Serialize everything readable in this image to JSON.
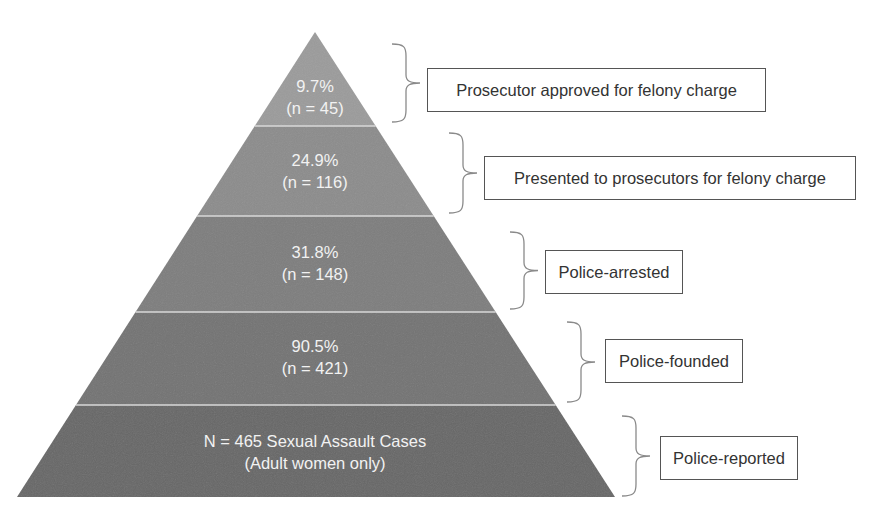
{
  "chart_data": {
    "type": "pyramid",
    "title": "",
    "total": {
      "n": 465,
      "label": "N = 465 Sexual Assault Cases",
      "sublabel": "(Adult women only)"
    },
    "tiers": [
      {
        "stage": "Prosecutor approved for felony charge",
        "percent": 9.7,
        "n": 45,
        "line1": "9.7%",
        "line2": "(n = 45)"
      },
      {
        "stage": "Presented to prosecutors for felony charge",
        "percent": 24.9,
        "n": 116,
        "line1": "24.9%",
        "line2": "(n = 116)"
      },
      {
        "stage": "Police-arrested",
        "percent": 31.8,
        "n": 148,
        "line1": "31.8%",
        "line2": "(n = 148)"
      },
      {
        "stage": "Police-founded",
        "percent": 90.5,
        "n": 421,
        "line1": "90.5%",
        "line2": "(n = 421)"
      },
      {
        "stage": "Police-reported",
        "percent": 100,
        "n": 465,
        "line1": "N = 465 Sexual Assault Cases",
        "line2": "(Adult women only)"
      }
    ]
  },
  "pyramid": {
    "apex": {
      "x": 315,
      "y": 32
    },
    "base_y": 497,
    "base_left": 17,
    "base_right": 615,
    "boundaries_y": [
      126,
      216,
      312,
      405
    ],
    "tier_colors": [
      "#9b9b9b",
      "#8c8c8c",
      "#7e7e7e",
      "#737373",
      "#676767"
    ],
    "separator_color": "#d8d8d8"
  },
  "labels": [
    {
      "line1": "9.7%",
      "line2": "(n = 45)"
    },
    {
      "line1": "24.9%",
      "line2": "(n = 116)"
    },
    {
      "line1": "31.8%",
      "line2": "(n = 148)"
    },
    {
      "line1": "90.5%",
      "line2": "(n = 421)"
    },
    {
      "line1": "N = 465 Sexual Assault Cases",
      "line2": "(Adult women only)"
    }
  ],
  "stages": [
    {
      "label": "Prosecutor approved for felony charge"
    },
    {
      "label": "Presented to prosecutors for felony charge"
    },
    {
      "label": "Police-arrested"
    },
    {
      "label": "Police-founded"
    },
    {
      "label": "Police-reported"
    }
  ]
}
